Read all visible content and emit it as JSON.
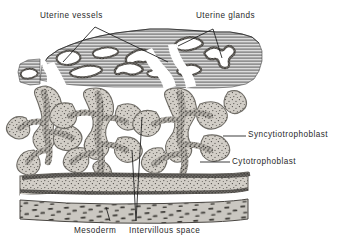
{
  "figure": {
    "kind": "histology-diagram",
    "labels": {
      "uterine_vessels": "Uterine vessels",
      "uterine_glands": "Uterine glands",
      "syncytiotrophoblast": "Syncytiotrophoblast",
      "cytotrophoblast": "Cytotrophoblast",
      "mesoderm": "Mesoderm",
      "intervillous_space": "Intervillous space"
    },
    "colors": {
      "background": "#ffffff",
      "ink": "#2a2a2a",
      "line": "#1a1a1a",
      "endometrium_fill": "#d8d8d8",
      "endometrium_hatch": "#4a4a4a",
      "villus_fill": "#cfcbc4",
      "villus_edge": "#8d8a84",
      "trophoblast_core": "#6e6b66",
      "mesoderm_fill": "#c9c6c0",
      "lumen_fill": "#ffffff"
    }
  }
}
